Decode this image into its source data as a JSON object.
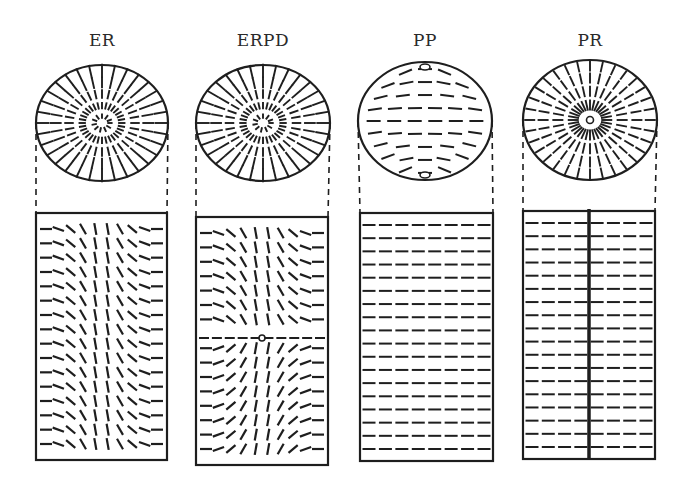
{
  "figure": {
    "panels": [
      {
        "id": "er",
        "label": "ER",
        "cx": 102,
        "cy": 123,
        "rx": 66,
        "ry": 58,
        "rect": {
          "x": 36,
          "y": 213,
          "w": 131,
          "h": 247
        },
        "pattern": "escaped-radial"
      },
      {
        "id": "erpd",
        "label": "ERPD",
        "cx": 263,
        "cy": 123,
        "rx": 67,
        "ry": 58,
        "rect": {
          "x": 196,
          "y": 217,
          "w": 132,
          "h": 248
        },
        "pattern": "escaped-radial-point-defect"
      },
      {
        "id": "pp",
        "label": "PP",
        "cx": 425,
        "cy": 121,
        "rx": 67,
        "ry": 59,
        "rect": {
          "x": 360,
          "y": 213,
          "w": 133,
          "h": 248
        },
        "pattern": "planar-polar"
      },
      {
        "id": "pr",
        "label": "PR",
        "cx": 590,
        "cy": 120,
        "rx": 67,
        "ry": 60,
        "rect": {
          "x": 523,
          "y": 211,
          "w": 132,
          "h": 248
        },
        "pattern": "planar-radial"
      }
    ],
    "colors": {
      "ink": "#1e1e1e",
      "background": "#ffffff"
    }
  }
}
